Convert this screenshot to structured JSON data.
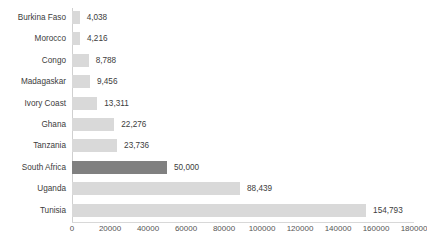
{
  "chart_data": {
    "type": "bar",
    "orientation": "horizontal",
    "title": "",
    "subtitle": "",
    "xlabel": "",
    "ylabel": "",
    "xlim": [
      0,
      180000
    ],
    "xticks": [
      0,
      20000,
      40000,
      60000,
      80000,
      100000,
      120000,
      140000,
      160000,
      180000
    ],
    "xtick_labels": [
      "0",
      "20000",
      "40000",
      "60000",
      "80000",
      "100000",
      "120000",
      "140000",
      "160000",
      "180000"
    ],
    "grid": false,
    "legend": null,
    "categories": [
      "Burkina Faso",
      "Morocco",
      "Congo",
      "Madagaskar",
      "Ivory Coast",
      "Ghana",
      "Tanzania",
      "South Africa",
      "Uganda",
      "Tunisia"
    ],
    "values": [
      4038,
      4216,
      8788,
      9456,
      13311,
      22276,
      23736,
      50000,
      88439,
      154793
    ],
    "value_labels": [
      "4,038",
      "4,216",
      "8,788",
      "9,456",
      "13,311",
      "22,276",
      "23,736",
      "50,000",
      "88,439",
      "154,793"
    ],
    "highlighted_category": "South Africa",
    "colors": {
      "bar": "#d9d9d9",
      "bar_highlight": "#808080",
      "axis": "#d0d0d0",
      "text": "#3c3c3c",
      "tick_text": "#555555",
      "background": "#ffffff"
    }
  }
}
